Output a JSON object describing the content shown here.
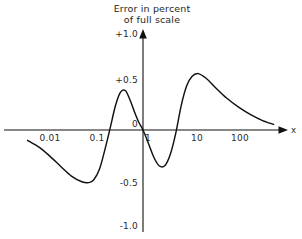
{
  "chart_data": {
    "type": "line",
    "title": "Error in percent of full scale",
    "title_line1": "Error in percent",
    "title_line2": "of full scale",
    "xlabel": "x",
    "ylabel": "",
    "xscale": "log",
    "yscale": "linear",
    "grid": false,
    "legend": null,
    "xlim": [
      0.003,
      700
    ],
    "ylim": [
      -1.0,
      1.0
    ],
    "x_tick_labels": [
      "0.01",
      "0.1",
      "1",
      "10",
      "100"
    ],
    "x_tick_values": [
      0.01,
      0.1,
      1,
      10,
      100
    ],
    "y_tick_labels": [
      "+1.0",
      "+0.5",
      "0",
      "-0.5",
      "-1.0"
    ],
    "y_tick_values": [
      1.0,
      0.5,
      0,
      -0.5,
      -1.0
    ],
    "series": [
      {
        "name": "error",
        "x": [
          0.0035,
          0.006,
          0.01,
          0.018,
          0.03,
          0.05,
          0.07,
          0.09,
          0.12,
          0.16,
          0.2,
          0.26,
          0.33,
          0.42,
          0.52,
          0.65,
          0.8,
          1.0,
          1.3,
          1.7,
          2.2,
          2.9,
          3.8,
          5.0,
          6.5,
          8.5,
          11.0,
          15.0,
          22.0,
          35.0,
          60.0,
          110.0,
          200.0,
          350.0,
          600.0
        ],
        "y": [
          -0.11,
          -0.18,
          -0.27,
          -0.39,
          -0.49,
          -0.55,
          -0.56,
          -0.53,
          -0.41,
          -0.18,
          0.02,
          0.26,
          0.4,
          0.42,
          0.33,
          0.2,
          0.09,
          0.0,
          -0.14,
          -0.29,
          -0.38,
          -0.38,
          -0.26,
          -0.03,
          0.26,
          0.47,
          0.57,
          0.6,
          0.55,
          0.45,
          0.34,
          0.24,
          0.16,
          0.1,
          0.06
        ]
      }
    ],
    "annotations": {
      "first_minimum": {
        "x": 0.075,
        "y": -0.56
      },
      "first_maximum": {
        "x": 0.42,
        "y": 0.42
      },
      "second_minimum": {
        "x": 2.5,
        "y": -0.38
      },
      "second_maximum": {
        "x": 15.0,
        "y": 0.6
      },
      "zero_crossings": [
        0.21,
        1.0,
        5.2
      ]
    },
    "colors": {
      "curve": "#111111",
      "axis": "#111111",
      "text": "#2b2b2b",
      "background": "#ffffff"
    }
  }
}
